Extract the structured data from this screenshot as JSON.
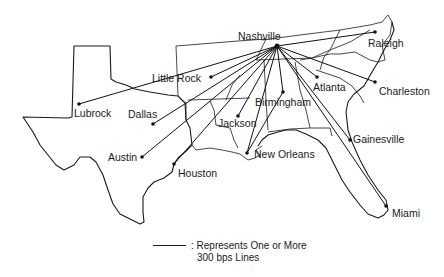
{
  "map": {
    "hub": "Nashville",
    "line_color": "#111111",
    "cities": [
      {
        "name": "Nashville",
        "x": 277,
        "y": 46,
        "label_x": 238,
        "label_y": 31
      },
      {
        "name": "Raleigh",
        "x": 375,
        "y": 32,
        "label_x": 368,
        "label_y": 38
      },
      {
        "name": "Charleston",
        "x": 375,
        "y": 82,
        "label_x": 379,
        "label_y": 86
      },
      {
        "name": "Atlanta",
        "x": 317,
        "y": 77,
        "label_x": 313,
        "label_y": 82
      },
      {
        "name": "Birmingham",
        "x": 283,
        "y": 92,
        "label_x": 255,
        "label_y": 97
      },
      {
        "name": "Little Rock",
        "x": 211,
        "y": 77,
        "label_x": 152,
        "label_y": 73
      },
      {
        "name": "Lubrock",
        "x": 79,
        "y": 104,
        "label_x": 74,
        "label_y": 108
      },
      {
        "name": "Dallas",
        "x": 153,
        "y": 124,
        "label_x": 128,
        "label_y": 109
      },
      {
        "name": "Jackson",
        "x": 238,
        "y": 116,
        "label_x": 218,
        "label_y": 118
      },
      {
        "name": "Austin",
        "x": 142,
        "y": 157,
        "label_x": 108,
        "label_y": 152
      },
      {
        "name": "Houston",
        "x": 174,
        "y": 164,
        "label_x": 178,
        "label_y": 168
      },
      {
        "name": "New Orleans",
        "x": 247,
        "y": 153,
        "label_x": 254,
        "label_y": 149
      },
      {
        "name": "Gainesville",
        "x": 350,
        "y": 140,
        "label_x": 353,
        "label_y": 134
      },
      {
        "name": "Miami",
        "x": 386,
        "y": 206,
        "label_x": 392,
        "label_y": 208
      }
    ],
    "connections": [
      {
        "from": "Nashville",
        "to": "Raleigh"
      },
      {
        "from": "Nashville",
        "to": "Charleston"
      },
      {
        "from": "Nashville",
        "to": "Atlanta"
      },
      {
        "from": "Nashville",
        "to": "Birmingham"
      },
      {
        "from": "Nashville",
        "to": "Little Rock"
      },
      {
        "from": "Nashville",
        "to": "Lubrock"
      },
      {
        "from": "Nashville",
        "to": "Dallas"
      },
      {
        "from": "Nashville",
        "to": "Jackson"
      },
      {
        "from": "Nashville",
        "to": "Austin"
      },
      {
        "from": "Nashville",
        "to": "Houston"
      },
      {
        "from": "Nashville",
        "to": "New Orleans"
      },
      {
        "from": "Nashville",
        "to": "Gainesville"
      },
      {
        "from": "Nashville",
        "to": "Miami"
      },
      {
        "from": "Birmingham",
        "to": "New Orleans"
      }
    ]
  },
  "legend": {
    "line1": ": Represents One or More",
    "line2": "300 bps Lines"
  }
}
